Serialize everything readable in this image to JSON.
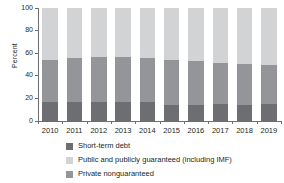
{
  "chart_data": {
    "type": "bar",
    "subtype": "stacked-100-percent",
    "title": "",
    "xlabel": "",
    "ylabel": "Percent",
    "ylim": [
      0,
      100
    ],
    "yticks": [
      0,
      20,
      40,
      60,
      80,
      100
    ],
    "ytick_labels": [
      "0",
      "20",
      "40",
      "60",
      "80",
      "100"
    ],
    "grid": false,
    "legend_position": "bottom-left",
    "categories": [
      "2010",
      "2011",
      "2012",
      "2013",
      "2014",
      "2015",
      "2016",
      "2017",
      "2018",
      "2019"
    ],
    "series": [
      {
        "name": "Short-term debt",
        "color": "#6d6e71",
        "values": [
          17,
          17,
          17,
          17,
          16.5,
          14,
          14,
          15,
          14.5,
          15
        ]
      },
      {
        "name": "Private nonguaranteed",
        "color": "#939598",
        "values": [
          37,
          38.5,
          39.5,
          40,
          39,
          40,
          39.5,
          36.5,
          36,
          35
        ]
      },
      {
        "name": "Public and publicly guaranteed (including IMF)",
        "color": "#d2d3d5",
        "values": [
          46,
          44.5,
          43.5,
          43,
          44.5,
          46,
          46.5,
          48.5,
          49.5,
          50
        ]
      }
    ],
    "stack_order_bottom_to_top": [
      "Short-term debt",
      "Private nonguaranteed",
      "Public and publicly guaranteed (including IMF)"
    ]
  },
  "legend": {
    "items": [
      {
        "label": "Short-term debt",
        "color": "#6d6e71"
      },
      {
        "label": "Public and publicly guaranteed (including IMF)",
        "color": "#d2d3d5"
      },
      {
        "label": "Private nonguaranteed",
        "color": "#939598"
      }
    ]
  },
  "colors": {
    "short_term_debt": "#6d6e71",
    "private_nonguaranteed": "#939598",
    "public_publicly_guaranteed": "#d2d3d5",
    "axis": "#6d6e71",
    "text": "#231f20",
    "background": "#ffffff"
  }
}
